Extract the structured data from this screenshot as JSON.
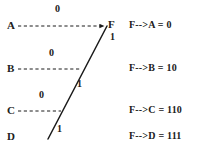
{
  "diagram": {
    "type": "huffman-code-tree",
    "nodes": [
      {
        "id": "A",
        "label": "A",
        "x": 7,
        "y": 20
      },
      {
        "id": "B",
        "label": "B",
        "x": 7,
        "y": 63
      },
      {
        "id": "C",
        "label": "C",
        "x": 7,
        "y": 105
      },
      {
        "id": "D",
        "label": "D",
        "x": 7,
        "y": 131
      },
      {
        "id": "F",
        "label": "F",
        "x": 108,
        "y": 19
      }
    ],
    "branch_labels": [
      {
        "id": "zero-a",
        "value": "0",
        "x": 55,
        "y": 4
      },
      {
        "id": "one-f",
        "value": "1",
        "x": 110,
        "y": 32
      },
      {
        "id": "zero-b",
        "value": "0",
        "x": 49,
        "y": 48
      },
      {
        "id": "one-b",
        "value": "1",
        "x": 77,
        "y": 79
      },
      {
        "id": "zero-c",
        "value": "0",
        "x": 39,
        "y": 90
      },
      {
        "id": "one-d",
        "value": "1",
        "x": 57,
        "y": 124
      }
    ],
    "edges": {
      "dashed_rows": [
        {
          "from": "A",
          "x1": 18,
          "x2": 106,
          "y": 26
        },
        {
          "from": "B",
          "x1": 18,
          "x2": 80,
          "y": 69
        },
        {
          "from": "C",
          "x1": 18,
          "x2": 61,
          "y": 111
        }
      ],
      "solid_diagonal": {
        "x1": 48,
        "y1": 139,
        "x2": 107,
        "y2": 26
      },
      "arrow_target": "F"
    },
    "colors": {
      "background": "#ffffff",
      "stroke": "#1a1a1a",
      "text": "#202020"
    }
  },
  "codes": {
    "title": "",
    "entries": [
      {
        "id": "code-a",
        "text": "F-->A = 0",
        "x": 0,
        "y": 20
      },
      {
        "id": "code-b",
        "text": "F-->B = 10",
        "x": 0,
        "y": 63
      },
      {
        "id": "code-c",
        "text": "F-->C = 110",
        "x": 0,
        "y": 105
      },
      {
        "id": "code-d",
        "text": "F-->D = 111",
        "x": 0,
        "y": 131
      }
    ]
  }
}
